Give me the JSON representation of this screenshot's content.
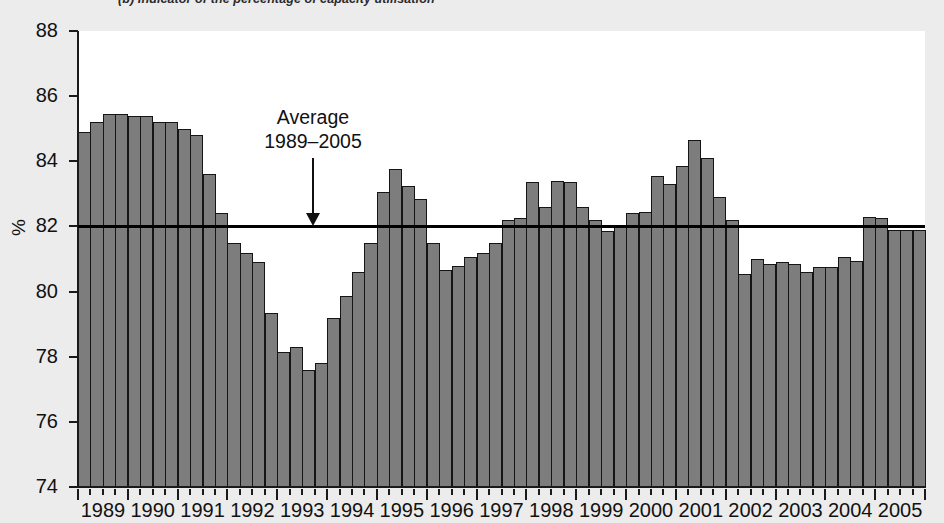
{
  "title": "(b)  Indicator of the percentage of capacity utilisation",
  "axis": {
    "y_label": "%",
    "y_ticks": [
      74,
      76,
      78,
      80,
      82,
      84,
      86,
      88
    ],
    "y_min": 74,
    "y_max": 88,
    "x_ticks": [
      "1989",
      "1990",
      "1991",
      "1992",
      "1993",
      "1994",
      "1995",
      "1996",
      "1997",
      "1998",
      "1999",
      "2000",
      "2001",
      "2002",
      "2003",
      "2004",
      "2005"
    ]
  },
  "annotation": {
    "line1": "Average",
    "line2": "1989–2005",
    "value": 82
  },
  "colors": {
    "bar_fill": "#7d7d7d",
    "bar_border": "#151515",
    "axis": "#1a1a1a",
    "plot_background": "#ffffff",
    "page_background": "#ececed",
    "average_line": "#000000"
  },
  "chart_data": {
    "type": "bar",
    "title": "(b)  Indicator of the percentage of capacity utilisation",
    "xlabel": "",
    "ylabel": "%",
    "ylim": [
      74,
      88
    ],
    "grid": false,
    "legend": null,
    "frequency": "quarterly",
    "categories": [
      "1989Q1",
      "1989Q2",
      "1989Q3",
      "1989Q4",
      "1990Q1",
      "1990Q2",
      "1990Q3",
      "1990Q4",
      "1991Q1",
      "1991Q2",
      "1991Q3",
      "1991Q4",
      "1992Q1",
      "1992Q2",
      "1992Q3",
      "1992Q4",
      "1993Q1",
      "1993Q2",
      "1993Q3",
      "1993Q4",
      "1994Q1",
      "1994Q2",
      "1994Q3",
      "1994Q4",
      "1995Q1",
      "1995Q2",
      "1995Q3",
      "1995Q4",
      "1996Q1",
      "1996Q2",
      "1996Q3",
      "1996Q4",
      "1997Q1",
      "1997Q2",
      "1997Q3",
      "1997Q4",
      "1998Q1",
      "1998Q2",
      "1998Q3",
      "1998Q4",
      "1999Q1",
      "1999Q2",
      "1999Q3",
      "1999Q4",
      "2000Q1",
      "2000Q2",
      "2000Q3",
      "2000Q4",
      "2001Q1",
      "2001Q2",
      "2001Q3",
      "2001Q4",
      "2002Q1",
      "2002Q2",
      "2002Q3",
      "2002Q4",
      "2003Q1",
      "2003Q2",
      "2003Q3",
      "2003Q4",
      "2004Q1",
      "2004Q2",
      "2004Q3",
      "2004Q4",
      "2005Q1",
      "2005Q2",
      "2005Q3",
      "2005Q4"
    ],
    "values": [
      84.9,
      85.2,
      85.45,
      85.45,
      85.4,
      85.4,
      85.2,
      85.2,
      85.0,
      84.8,
      83.6,
      82.4,
      81.5,
      81.2,
      80.9,
      79.35,
      78.15,
      78.3,
      77.6,
      77.8,
      79.2,
      79.85,
      80.6,
      81.5,
      83.05,
      83.75,
      83.25,
      82.85,
      81.5,
      80.65,
      80.8,
      81.05,
      81.2,
      81.5,
      82.2,
      82.25,
      83.35,
      82.6,
      83.4,
      83.35,
      82.6,
      82.2,
      81.85,
      82.0,
      82.4,
      82.45,
      83.55,
      83.3,
      83.85,
      84.65,
      84.1,
      82.9,
      82.2,
      80.55,
      81.0,
      80.85,
      80.9,
      80.85,
      80.6,
      80.75,
      80.75,
      81.05,
      80.95,
      82.3,
      82.25,
      81.9,
      81.9,
      81.9
    ],
    "reference_line": {
      "label": "Average 1989–2005",
      "value": 82
    }
  }
}
